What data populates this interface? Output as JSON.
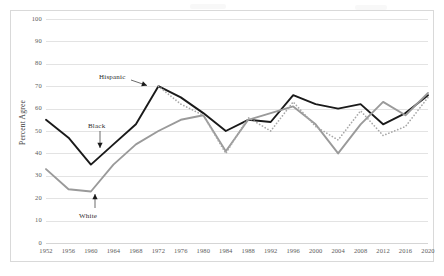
{
  "chart_data": {
    "type": "line",
    "title": "",
    "subtitle": "",
    "xlabel": "",
    "ylabel": "Percent Agree",
    "xlim": [
      1952,
      2020
    ],
    "ylim": [
      0,
      100
    ],
    "grid": true,
    "legend_position": "inline-annotations",
    "categories": [
      1952,
      1956,
      1960,
      1964,
      1968,
      1972,
      1976,
      1980,
      1984,
      1988,
      1992,
      1996,
      2000,
      2004,
      2008,
      2012,
      2016,
      2020
    ],
    "x_tick_labels": [
      "1952",
      "1956",
      "1960",
      "1964",
      "1968",
      "1972",
      "1976",
      "1980",
      "1984",
      "1988",
      "1992",
      "1996",
      "2000",
      "2004",
      "2008",
      "2012",
      "2016",
      "2020"
    ],
    "y_tick_labels": [
      "0",
      "10",
      "20",
      "30",
      "40",
      "50",
      "60",
      "70",
      "80",
      "90",
      "100"
    ],
    "y_ticks": [
      0,
      10,
      20,
      30,
      40,
      50,
      60,
      70,
      80,
      90,
      100
    ],
    "series": [
      {
        "name": "Black",
        "color": "#1a1a1a",
        "style": "solid",
        "annotation": "Black",
        "values": [
          55,
          47,
          35,
          44,
          53,
          70,
          65,
          58,
          50,
          55,
          54,
          66,
          62,
          60,
          62,
          53,
          58,
          66
        ]
      },
      {
        "name": "White",
        "color": "#9a9a9a",
        "style": "solid",
        "annotation": "White",
        "values": [
          33,
          24,
          23,
          35,
          44,
          50,
          55,
          57,
          41,
          55,
          58,
          61,
          53,
          40,
          53,
          63,
          57,
          67
        ]
      },
      {
        "name": "Hispanic",
        "color": "#a8a8a8",
        "style": "dotted",
        "annotation": "Hispanic",
        "start_year": 1970,
        "values": [
          null,
          null,
          null,
          null,
          null,
          70,
          62,
          57,
          40,
          56,
          50,
          63,
          52,
          46,
          59,
          48,
          52,
          65
        ]
      }
    ],
    "annotations": [
      {
        "label": "Hispanic",
        "points_to_year": 1970,
        "points_to_value": 70
      },
      {
        "label": "Black",
        "points_to_year": 1960,
        "points_to_value": 40
      },
      {
        "label": "White",
        "points_to_year": 1959,
        "points_to_value": 23
      }
    ]
  }
}
